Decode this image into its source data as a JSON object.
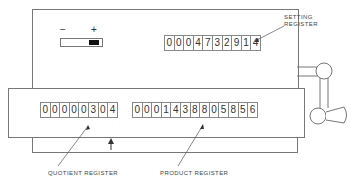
{
  "setting_register": {
    "label_line1": "SETTING",
    "label_line2": "REGISTER",
    "digits": [
      "0",
      "0",
      "0",
      "4",
      "7",
      "3",
      "2",
      "9",
      "1",
      "4"
    ]
  },
  "quotient_register": {
    "label": "QUOTIENT  REGISTER",
    "digits": [
      "0",
      "0",
      "0",
      "0",
      "0",
      "3",
      "0",
      "4"
    ]
  },
  "product_register": {
    "label": "PRODUCT  REGISTER",
    "digits": [
      "0",
      "0",
      "0",
      "1",
      "4",
      "3",
      "8",
      "8",
      "0",
      "5",
      "8",
      "5",
      "6"
    ]
  },
  "sign_indicator": {
    "minus": "−",
    "plus": "+"
  }
}
